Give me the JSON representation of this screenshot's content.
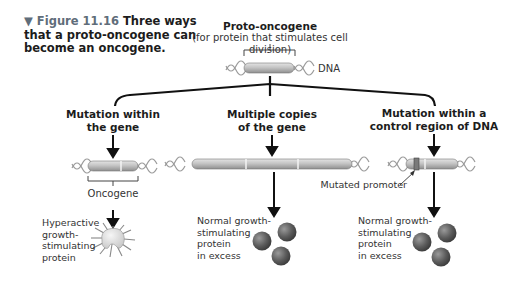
{
  "caption": {
    "figure_label": "▼ Figure 11.16",
    "text": "Three ways that a proto-oncogene can become an oncogene."
  },
  "top": {
    "title": "Proto-oncogene",
    "subtitle": "(for protein that stimulates cell division)",
    "dna_label": "DNA"
  },
  "branches": [
    {
      "heading_line1": "Mutation within",
      "heading_line2": "the gene",
      "gene_label": "Oncogene",
      "result_lines": [
        "Hyperactive",
        "growth-",
        "stimulating",
        "protein"
      ]
    },
    {
      "heading_line1": "Multiple copies",
      "heading_line2": "of the gene",
      "result_lines": [
        "Normal growth-",
        "stimulating",
        "protein",
        "in excess"
      ]
    },
    {
      "heading_line1": "Mutation within a",
      "heading_line2": "control region of DNA",
      "pointer_label": "Mutated promoter",
      "result_lines": [
        "Normal growth-",
        "stimulating",
        "protein",
        "in excess"
      ]
    }
  ],
  "colors": {
    "gene_fill": "#b9b9b9",
    "gene_stroke": "#6e6e6e",
    "dna_strand": "#9a9a9a",
    "protein_sphere": "#5c5c5c",
    "figure_label": "#5f6d7a",
    "lines": "#111111"
  }
}
